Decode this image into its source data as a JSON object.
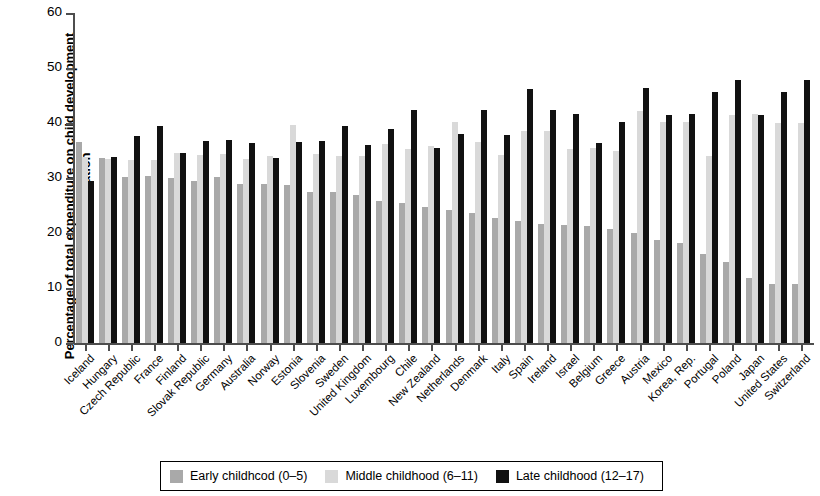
{
  "chart_data": {
    "type": "bar",
    "title": "",
    "xlabel": "",
    "ylabel": "Percentage of total expenditure on child development and education",
    "ylim": [
      0,
      60
    ],
    "yticks": [
      0,
      10,
      20,
      30,
      40,
      50,
      60
    ],
    "grid": false,
    "legend_position": "bottom",
    "categories": [
      "Iceland",
      "Hungary",
      "Czech Republic",
      "France",
      "Finland",
      "Slovak Republic",
      "Germany",
      "Australia",
      "Norway",
      "Estonia",
      "Slovenia",
      "Sweden",
      "United Kingdom",
      "Luxembourg",
      "Chile",
      "New Zealand",
      "Netherlands",
      "Denmark",
      "Italy",
      "Spain",
      "Ireland",
      "Israel",
      "Belgium",
      "Greece",
      "Austria",
      "Mexico",
      "Korea, Rep.",
      "Portugal",
      "Poland",
      "Japan",
      "United States",
      "Switzerland"
    ],
    "series": [
      {
        "name": "Early childhood (0–5)",
        "color": "#a9a9a9",
        "values": [
          36.5,
          33.6,
          30.2,
          30.3,
          30.0,
          29.5,
          30.2,
          29.0,
          29.0,
          28.8,
          27.5,
          27.5,
          27.0,
          25.8,
          25.5,
          24.8,
          24.2,
          23.7,
          22.8,
          22.2,
          21.7,
          21.4,
          21.2,
          20.8,
          20.0,
          18.8,
          18.2,
          16.2,
          14.7,
          11.8,
          10.8,
          10.8
        ]
      },
      {
        "name": "Middle childhood (6–11)",
        "color": "#d9d9d9",
        "values": [
          33.8,
          33.5,
          33.2,
          33.3,
          34.6,
          34.1,
          34.4,
          33.5,
          34.0,
          39.6,
          34.3,
          34.0,
          34.0,
          36.2,
          35.2,
          35.8,
          40.1,
          36.5,
          34.2,
          38.5,
          38.5,
          35.2,
          35.4,
          34.9,
          42.2,
          40.2,
          40.2,
          34.0,
          41.4,
          41.7,
          40.0,
          40.0
        ]
      },
      {
        "name": "Late childhood (12–17)",
        "color": "#111111",
        "values": [
          29.4,
          33.8,
          37.6,
          39.5,
          34.6,
          36.8,
          37.0,
          36.3,
          33.7,
          36.6,
          36.8,
          39.4,
          36.0,
          38.9,
          42.4,
          35.4,
          38.0,
          42.4,
          37.9,
          46.2,
          42.3,
          41.6,
          36.3,
          40.1,
          46.4,
          41.4,
          41.7,
          45.6,
          47.8,
          41.4,
          45.6,
          47.8
        ]
      }
    ]
  },
  "legend": {
    "items": [
      {
        "label": "Early childhcod (0–5)",
        "color": "#a9a9a9"
      },
      {
        "label": "Middle childhood (6–11)",
        "color": "#d9d9d9"
      },
      {
        "label": "Late childhood (12–17)",
        "color": "#111111"
      }
    ]
  },
  "axis": {
    "y_title": "Percentage of total expenditure on child development and education",
    "y_ticks": [
      "0",
      "10",
      "20",
      "30",
      "40",
      "50",
      "60"
    ]
  }
}
